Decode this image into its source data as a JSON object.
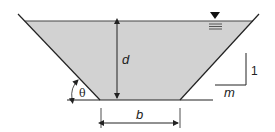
{
  "diagram": {
    "type": "trapezoidal-channel-cross-section",
    "labels": {
      "depth": "d",
      "bottom_width": "b",
      "angle": "θ",
      "slope_vertical": "1",
      "slope_horizontal": "m"
    },
    "symbols": {
      "water_surface": "water-surface-triangle-icon"
    },
    "colors": {
      "water_fill": "#d2d2d2",
      "line": "#222222",
      "background": "#ffffff"
    }
  }
}
